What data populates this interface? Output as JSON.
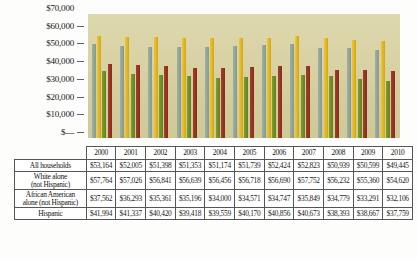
{
  "chart_data": {
    "type": "bar",
    "title": "",
    "xlabel": "",
    "ylabel": "",
    "categories": [
      "2000",
      "2001",
      "2002",
      "2003",
      "2004",
      "2005",
      "2006",
      "2007",
      "2008",
      "2009",
      "2010"
    ],
    "ylim": [
      0,
      70000
    ],
    "yticks": [
      "$70,000",
      "$60,000",
      "$50,000",
      "$40,000",
      "$30,000",
      "$20,000",
      "$10,000",
      "$—"
    ],
    "ytick_values": [
      70000,
      60000,
      50000,
      40000,
      30000,
      20000,
      10000,
      0
    ],
    "grid": false,
    "legend_position": "table-row-labels",
    "series": [
      {
        "name": "All households",
        "color": "#8d9dc4",
        "bar_color": "#93a69a",
        "values": [
          53164,
          52005,
          51398,
          51353,
          51174,
          51739,
          52424,
          52823,
          50939,
          50599,
          49445
        ],
        "labels": [
          "$53,164",
          "$52,005",
          "$51,398",
          "$51,353",
          "$51,174",
          "$51,739",
          "$52,424",
          "$52,823",
          "$50,939",
          "$50,599",
          "$49,445"
        ]
      },
      {
        "name": "White alone (not Hispanic)",
        "color": "#f0a81e",
        "bar_color": "#e3b61b",
        "values": [
          57764,
          57026,
          56841,
          56639,
          56456,
          56718,
          56690,
          57752,
          56232,
          55360,
          54620
        ],
        "labels": [
          "$57,764",
          "$57,026",
          "$56,841",
          "$56,639",
          "$56,456",
          "$56,718",
          "$56,690",
          "$57,752",
          "$56,232",
          "$55,360",
          "$54,620"
        ]
      },
      {
        "name": "African American alone (not Hispanic)",
        "color": "#5eb731",
        "bar_color": "#6f9026",
        "values": [
          37562,
          36293,
          35361,
          35196,
          34000,
          34571,
          34747,
          35849,
          34779,
          33291,
          32106
        ],
        "labels": [
          "$37,562",
          "$36,293",
          "$35,361",
          "$35,196",
          "$34,000",
          "$34,571",
          "$34,747",
          "$35,849",
          "$34,779",
          "$33,291",
          "$32,106"
        ]
      },
      {
        "name": "Hispanic",
        "color": "#8e2a72",
        "bar_color": "#993322",
        "values": [
          41994,
          41337,
          40420,
          39418,
          39559,
          40170,
          40856,
          40673,
          38393,
          38667,
          37759
        ],
        "labels": [
          "$41,994",
          "$41,337",
          "$40,420",
          "$39,418",
          "$39,559",
          "$40,170",
          "$40,856",
          "$40,673",
          "$38,393",
          "$38,667",
          "$37,759"
        ]
      }
    ]
  },
  "table": {
    "corner_label": "",
    "row_labels": [
      "All households",
      "White alone\n(not Hispanic)",
      "African American\nalone (not Hispanic)",
      "Hispanic"
    ],
    "row_label_line1": [
      "All households",
      "White alone",
      "African American",
      "Hispanic"
    ],
    "row_label_line2": [
      "",
      "(not Hispanic)",
      "alone (not Hispanic)",
      ""
    ]
  }
}
